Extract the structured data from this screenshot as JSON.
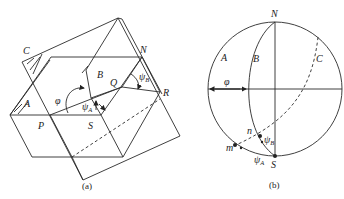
{
  "figure_a": {
    "caption": "(a)",
    "labels": {
      "C": "C",
      "N": "N",
      "B": "B",
      "Q": "Q",
      "R": "R",
      "A": "A",
      "P": "P",
      "S": "S",
      "phi": "φ",
      "psi": "ψ",
      "psi_A_sub": "A",
      "psi_B_sub": "B"
    }
  },
  "figure_b": {
    "caption": "(b)",
    "labels": {
      "N": "N",
      "S": "S",
      "A": "A",
      "B": "B",
      "C": "C",
      "phi": "φ",
      "n": "n",
      "m": "m",
      "psi": "ψ",
      "psi_A_sub": "A",
      "psi_B_sub": "B"
    }
  }
}
